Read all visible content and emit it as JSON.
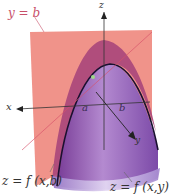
{
  "labels": {
    "plane": "y = b",
    "z_axis": "z",
    "x_axis": "x",
    "y_axis": "y",
    "point_a": "a",
    "point_b": "b",
    "trace_curve": "z = f (x,b)",
    "surface": "z = f (x,y)"
  },
  "colors": {
    "plane": "#ef8a80",
    "surface_upper": "#a8467a",
    "surface_lower": "#8a5cb8",
    "surface_base": "#c9b8e6",
    "trace_curve": "#1a1030",
    "point": "#9fd88a",
    "axes": "#333333"
  }
}
